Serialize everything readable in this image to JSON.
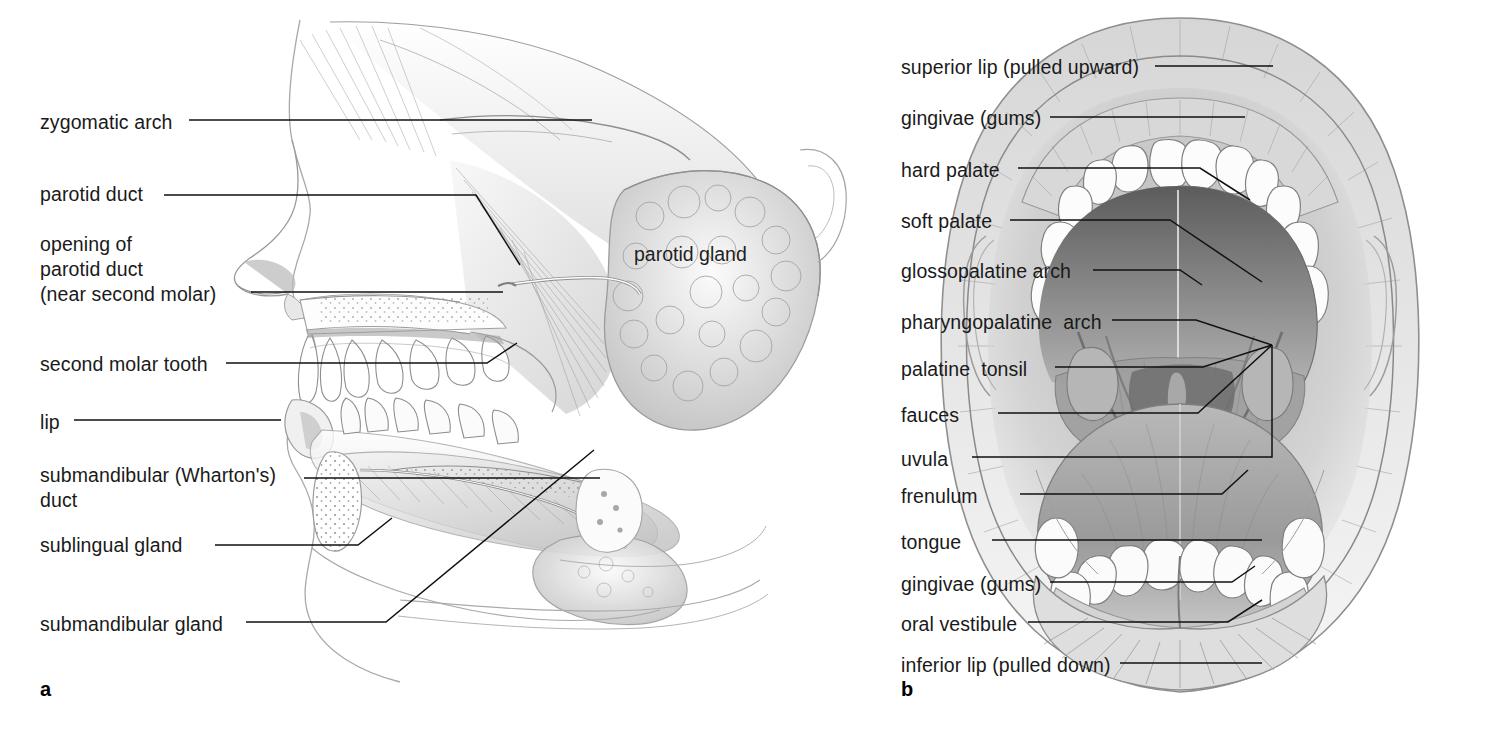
{
  "figure": {
    "background_color": "#ffffff",
    "line_color": "#111111",
    "text_color": "#1a1a1a"
  },
  "panel_a": {
    "letter": "a",
    "inline_labels": [
      {
        "name": "parotid-gland",
        "text": "parotid gland",
        "x": 634,
        "y": 243
      }
    ],
    "labels": [
      {
        "name": "zygomatic-arch",
        "text": "zygomatic arch",
        "x": 40,
        "y": 110,
        "lines": 1
      },
      {
        "name": "parotid-duct",
        "text": "parotid duct",
        "x": 40,
        "y": 182,
        "lines": 1
      },
      {
        "name": "opening-of-parotid-duct",
        "text": "opening of\nparotid duct\n(near second molar)",
        "x": 40,
        "y": 232,
        "lines": 3
      },
      {
        "name": "second-molar-tooth",
        "text": "second molar tooth",
        "x": 40,
        "y": 352,
        "lines": 1
      },
      {
        "name": "lip",
        "text": "lip",
        "x": 40,
        "y": 410,
        "lines": 1
      },
      {
        "name": "submandibular-whartons-duct",
        "text": "submandibular (Wharton's)\nduct",
        "x": 40,
        "y": 463,
        "lines": 2
      },
      {
        "name": "sublingual-gland",
        "text": "sublingual gland",
        "x": 40,
        "y": 533,
        "lines": 1
      },
      {
        "name": "submandibular-gland",
        "text": "submandibular gland",
        "x": 40,
        "y": 612,
        "lines": 1
      }
    ]
  },
  "panel_b": {
    "letter": "b",
    "labels": [
      {
        "name": "superior-lip",
        "text": "superior lip (pulled upward)",
        "x": 901,
        "y": 55,
        "lines": 1
      },
      {
        "name": "gingivae-upper",
        "text": "gingivae (gums)",
        "x": 901,
        "y": 106,
        "lines": 1
      },
      {
        "name": "hard-palate",
        "text": "hard palate",
        "x": 901,
        "y": 158,
        "lines": 1
      },
      {
        "name": "soft-palate",
        "text": "soft palate",
        "x": 901,
        "y": 209,
        "lines": 1
      },
      {
        "name": "glossopalatine-arch",
        "text": "glossopalatine arch",
        "x": 901,
        "y": 259,
        "lines": 1
      },
      {
        "name": "pharyngopalatine-arch",
        "text": "pharyngopalatine  arch",
        "x": 901,
        "y": 310,
        "lines": 1
      },
      {
        "name": "palatine-tonsil",
        "text": "palatine  tonsil",
        "x": 901,
        "y": 357,
        "lines": 1
      },
      {
        "name": "fauces",
        "text": "fauces",
        "x": 901,
        "y": 403,
        "lines": 1
      },
      {
        "name": "uvula",
        "text": "uvula",
        "x": 901,
        "y": 447,
        "lines": 1
      },
      {
        "name": "frenulum",
        "text": "frenulum",
        "x": 901,
        "y": 484,
        "lines": 1
      },
      {
        "name": "tongue",
        "text": "tongue",
        "x": 901,
        "y": 530,
        "lines": 1
      },
      {
        "name": "gingivae-lower",
        "text": "gingivae (gums)",
        "x": 901,
        "y": 572,
        "lines": 1
      },
      {
        "name": "oral-vestibule",
        "text": "oral vestibule",
        "x": 901,
        "y": 612,
        "lines": 1
      },
      {
        "name": "inferior-lip",
        "text": "inferior lip (pulled down)",
        "x": 901,
        "y": 653,
        "lines": 1
      }
    ]
  }
}
